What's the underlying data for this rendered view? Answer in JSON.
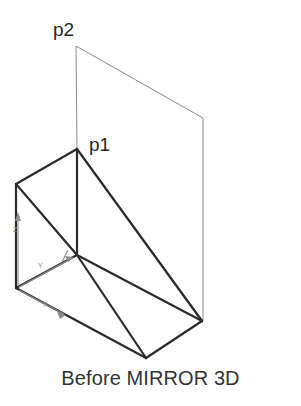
{
  "figure": {
    "caption": "Before MIRROR 3D",
    "background_color": "#ffffff",
    "width": 301,
    "height": 406
  },
  "labels": {
    "p1": "p1",
    "p2": "p2"
  },
  "ucs_icon": {
    "axis_z": "Z",
    "axis_y": "Y",
    "axis_x": "X",
    "color": "#8d8d8d"
  },
  "colors": {
    "solid_stroke": "#2b2b2b",
    "plane_stroke": "#8a8a8a",
    "text": "#262626",
    "caption": "#333333"
  },
  "geometry": {
    "mirror_plane": {
      "name": "mirror-plane",
      "stroke_width": 1,
      "points": "76,46 203,118 203,321 77,149"
    },
    "wedge_solid": {
      "name": "wedge-solid",
      "stroke_width": 2.2,
      "vertices": {
        "apex_p1": "77,149",
        "back_left_top": "16,184",
        "origin_bottom_left": "16,288",
        "center_junction": "77,255",
        "right_bottom": "202,321",
        "front_bottom": "146,358"
      },
      "edges": [
        "77,149 16,184",
        "16,184 16,288",
        "77,149 77,255",
        "16,184 77,255",
        "16,288 77,255",
        "77,149 202,321",
        "77,255 202,321",
        "77,255 146,358",
        "16,288 146,358",
        "146,358 202,321"
      ]
    }
  }
}
